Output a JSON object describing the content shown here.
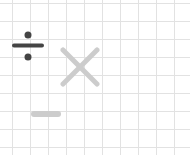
{
  "symbols": [
    {
      "name": "divide",
      "color": "#444444"
    },
    {
      "name": "multiply",
      "color": "#cccccc"
    },
    {
      "name": "minus",
      "color": "#cccccc"
    }
  ],
  "grid": {
    "spacing": 18,
    "line_color": "#e2e2e2"
  }
}
